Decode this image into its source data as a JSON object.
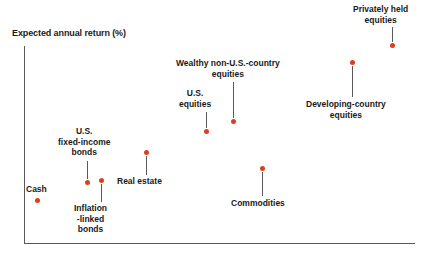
{
  "chart_data": {
    "type": "scatter",
    "title": "",
    "ylabel": "Expected annual return (%)",
    "xlabel": "",
    "grid": false,
    "legend": null,
    "axes": {
      "y_axis_visible": true,
      "x_axis_visible": true,
      "y_ticks": [],
      "x_ticks": [],
      "note": "Unlabeled qualitative axes; vertical position encodes expected annual return, horizontal position encodes increasing risk/illiquidity"
    },
    "marker_color": "#d9411e",
    "axis_color": "#59595b",
    "text_color": "#1a1a1a",
    "points": [
      {
        "label": "Cash",
        "label_lines": [
          "Cash"
        ],
        "x": 37,
        "y": 200,
        "label_x": 26,
        "label_y": 184,
        "label_align": "center",
        "leader": false,
        "leader_x": 0,
        "leader_top": 0,
        "leader_height": 0
      },
      {
        "label": "U.S. fixed-income bonds",
        "label_lines": [
          "U.S.",
          "fixed-income",
          "bonds"
        ],
        "x": 87,
        "y": 182,
        "label_x": 58,
        "label_y": 126,
        "label_align": "center",
        "leader": true,
        "leader_x": 87,
        "leader_top": 161,
        "leader_height": 18
      },
      {
        "label": "Inflation-linked bonds",
        "label_lines": [
          "Inflation",
          "-linked",
          "bonds"
        ],
        "x": 101,
        "y": 180,
        "label_x": 74,
        "label_y": 203,
        "label_align": "center",
        "leader": true,
        "leader_x": 101,
        "leader_top": 184,
        "leader_height": 18
      },
      {
        "label": "Real estate",
        "label_lines": [
          "Real estate"
        ],
        "x": 146,
        "y": 152,
        "label_x": 117,
        "label_y": 176,
        "label_align": "center",
        "leader": true,
        "leader_x": 146,
        "leader_top": 156,
        "leader_height": 19
      },
      {
        "label": "U.S. equities",
        "label_lines": [
          "U.S.",
          "equities"
        ],
        "x": 206,
        "y": 131,
        "label_x": 179,
        "label_y": 88,
        "label_align": "center",
        "leader": true,
        "leader_x": 206,
        "leader_top": 112,
        "leader_height": 16
      },
      {
        "label": "Wealthy non-U.S.-country equities",
        "label_lines": [
          "Wealthy non-U.S.-country",
          "equities"
        ],
        "x": 233,
        "y": 121,
        "label_x": 176,
        "label_y": 58,
        "label_align": "center",
        "leader": true,
        "leader_x": 233,
        "leader_top": 82,
        "leader_height": 36
      },
      {
        "label": "Commodities",
        "label_lines": [
          "Commodities"
        ],
        "x": 262,
        "y": 168,
        "label_x": 231,
        "label_y": 198,
        "label_align": "center",
        "leader": true,
        "leader_x": 262,
        "leader_top": 172,
        "leader_height": 24
      },
      {
        "label": "Developing-country equities",
        "label_lines": [
          "Developing-country",
          "equities"
        ],
        "x": 352,
        "y": 62,
        "label_x": 306,
        "label_y": 99,
        "label_align": "center",
        "leader": true,
        "leader_x": 352,
        "leader_top": 66,
        "leader_height": 31
      },
      {
        "label": "Privately held equities",
        "label_lines": [
          "Privately held",
          "equities"
        ],
        "x": 392,
        "y": 45,
        "label_x": 353,
        "label_y": 4,
        "label_align": "center",
        "leader": true,
        "leader_x": 392,
        "leader_top": 27,
        "leader_height": 15
      }
    ]
  }
}
